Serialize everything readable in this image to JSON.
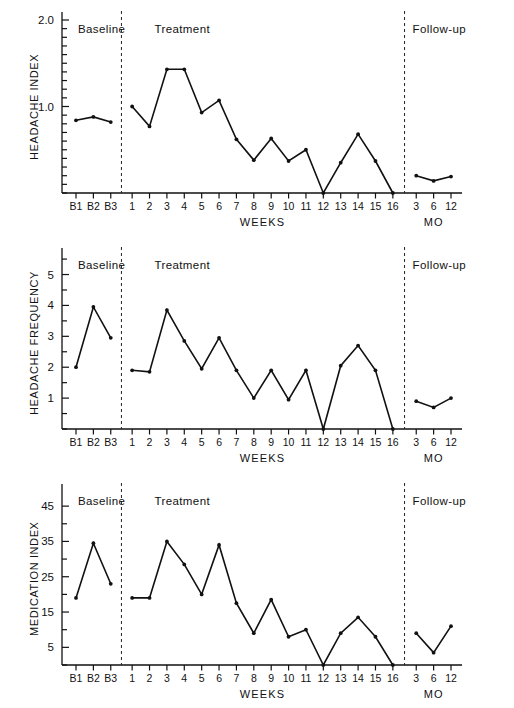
{
  "figure": {
    "background": "#ffffff",
    "line_color": "#111111",
    "marker_color": "#111111",
    "divider_style": "dashed"
  },
  "shared": {
    "xlabel": "WEEKS",
    "followup_unit_label": "MO",
    "phase_labels": [
      "Baseline",
      "Treatment",
      "Follow-up"
    ],
    "xtick_labels": [
      "B1",
      "B2",
      "B3",
      "1",
      "2",
      "3",
      "4",
      "5",
      "6",
      "7",
      "8",
      "9",
      "10",
      "11",
      "12",
      "13",
      "14",
      "15",
      "16",
      "3",
      "6",
      "12"
    ],
    "baseline_ticks": [
      "B1",
      "B2",
      "B3"
    ],
    "treatment_ticks": [
      "1",
      "2",
      "3",
      "4",
      "5",
      "6",
      "7",
      "8",
      "9",
      "10",
      "11",
      "12",
      "13",
      "14",
      "15",
      "16"
    ],
    "followup_ticks": [
      "3",
      "6",
      "12"
    ]
  },
  "chart_data": [
    {
      "type": "line",
      "title": "",
      "ylabel": "HEADACHE INDEX",
      "xlabel": "WEEKS",
      "ylim": [
        0,
        2.0
      ],
      "ytick_values": [
        1.0,
        2.0
      ],
      "ytick_labels": [
        "1.0",
        "2.0"
      ],
      "yminor_step": 0.1,
      "grid": false,
      "legend": "none",
      "phases": [
        {
          "name": "Baseline",
          "categories": [
            "B1",
            "B2",
            "B3"
          ],
          "values": [
            0.84,
            0.88,
            0.82
          ]
        },
        {
          "name": "Treatment",
          "categories": [
            "1",
            "2",
            "3",
            "4",
            "5",
            "6",
            "7",
            "8",
            "9",
            "10",
            "11",
            "12",
            "13",
            "14",
            "15",
            "16"
          ],
          "values": [
            1.0,
            0.77,
            1.43,
            1.43,
            0.93,
            1.07,
            0.62,
            0.38,
            0.63,
            0.37,
            0.5,
            0.0,
            0.35,
            0.68,
            0.37,
            0.0
          ]
        },
        {
          "name": "Follow-up",
          "categories": [
            "3",
            "6",
            "12"
          ],
          "values": [
            0.2,
            0.14,
            0.19
          ]
        }
      ]
    },
    {
      "type": "line",
      "title": "",
      "ylabel": "HEADACHE FREQUENCY",
      "xlabel": "WEEKS",
      "ylim": [
        0,
        5.6
      ],
      "ytick_values": [
        1,
        2,
        3,
        4,
        5
      ],
      "ytick_labels": [
        "1",
        "2",
        "3",
        "4",
        "5"
      ],
      "yminor_step": 0.5,
      "grid": false,
      "legend": "none",
      "phases": [
        {
          "name": "Baseline",
          "categories": [
            "B1",
            "B2",
            "B3"
          ],
          "values": [
            2.0,
            3.95,
            2.95
          ]
        },
        {
          "name": "Treatment",
          "categories": [
            "1",
            "2",
            "3",
            "4",
            "5",
            "6",
            "7",
            "8",
            "9",
            "10",
            "11",
            "12",
            "13",
            "14",
            "15",
            "16"
          ],
          "values": [
            1.9,
            1.85,
            3.85,
            2.85,
            1.95,
            2.95,
            1.9,
            1.0,
            1.9,
            0.95,
            1.9,
            0.0,
            2.05,
            2.7,
            1.9,
            0.0
          ]
        },
        {
          "name": "Follow-up",
          "categories": [
            "3",
            "6",
            "12"
          ],
          "values": [
            0.9,
            0.7,
            1.0
          ]
        }
      ]
    },
    {
      "type": "line",
      "title": "",
      "ylabel": "MEDICATION INDEX",
      "xlabel": "WEEKS",
      "ylim": [
        0,
        49
      ],
      "ytick_values": [
        5,
        15,
        25,
        35,
        45
      ],
      "ytick_labels": [
        "5",
        "15",
        "25",
        "35",
        "45"
      ],
      "yminor_step": 5,
      "grid": false,
      "legend": "none",
      "phases": [
        {
          "name": "Baseline",
          "categories": [
            "B1",
            "B2",
            "B3"
          ],
          "values": [
            19,
            34.5,
            23
          ]
        },
        {
          "name": "Treatment",
          "categories": [
            "1",
            "2",
            "3",
            "4",
            "5",
            "6",
            "7",
            "8",
            "9",
            "10",
            "11",
            "12",
            "13",
            "14",
            "15",
            "16"
          ],
          "values": [
            19,
            19,
            35,
            28.5,
            20,
            34,
            17.5,
            9,
            18.5,
            8,
            10,
            0,
            9,
            13.5,
            8,
            0
          ]
        },
        {
          "name": "Follow-up",
          "categories": [
            "3",
            "6",
            "12"
          ],
          "values": [
            9,
            3.5,
            11
          ]
        }
      ]
    }
  ]
}
